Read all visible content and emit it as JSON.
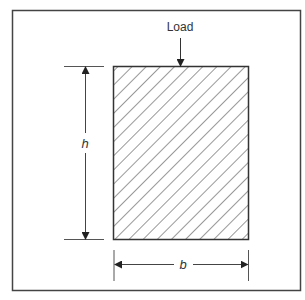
{
  "figure": {
    "type": "cross-section-diagram",
    "colors": {
      "stroke": "#333333",
      "frame": "#444444",
      "background": "#ffffff",
      "hatch": "#444444"
    },
    "load": {
      "label": "Load"
    },
    "height_dimension": {
      "label": "h"
    },
    "width_dimension": {
      "label": "b"
    },
    "section": {
      "fill_pattern": "diagonal-hatch-45deg"
    }
  }
}
